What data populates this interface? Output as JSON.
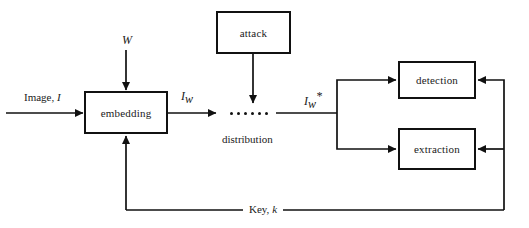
{
  "figure": {
    "background_color": "#ffffff",
    "stroke_color": "#111111"
  },
  "nodes": [
    {
      "id": "embedding",
      "label": "embedding",
      "x": 84,
      "y": 91,
      "w": 84,
      "h": 43
    },
    {
      "id": "attack",
      "label": "attack",
      "x": 216,
      "y": 11,
      "w": 75,
      "h": 43
    },
    {
      "id": "detection",
      "label": "detection",
      "x": 398,
      "y": 61,
      "w": 78,
      "h": 38
    },
    {
      "id": "extraction",
      "label": "extraction",
      "x": 398,
      "y": 128,
      "w": 78,
      "h": 42
    }
  ],
  "labels": {
    "image_input": "Image, ",
    "image_input_symbol": "I",
    "watermark": "W",
    "watermarked_symbol": "I",
    "watermarked_sub": "w",
    "attacked_symbol": "I",
    "attacked_sub": "w",
    "attacked_sup": "*",
    "distribution": "distribution",
    "key": "Key, ",
    "key_symbol": "k"
  },
  "dots": {
    "name": "distribution-dots",
    "count": 6
  }
}
